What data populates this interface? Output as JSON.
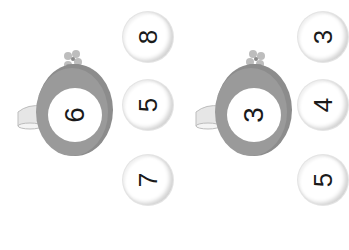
{
  "colors": {
    "pot": "#8c8c8c",
    "pot_dark": "#6f6f6f",
    "flower": "#b5b5b5",
    "bubble_shadow": "#d0d0d0",
    "digit": "#1a1a1a"
  },
  "groups": [
    {
      "pot": {
        "icon": "watering-can-icon",
        "number": "6"
      },
      "options": [
        {
          "label": "8"
        },
        {
          "label": "5"
        },
        {
          "label": "7"
        }
      ]
    },
    {
      "pot": {
        "icon": "watering-can-icon",
        "number": "3"
      },
      "options": [
        {
          "label": "3"
        },
        {
          "label": "4"
        },
        {
          "label": "5"
        }
      ]
    }
  ]
}
